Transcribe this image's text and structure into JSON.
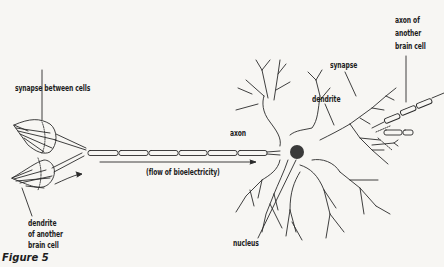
{
  "figure": {
    "caption": "Figure 5"
  },
  "labels": {
    "synapse_between_cells": "synapse between cells",
    "dendrite_other_1": "dendrite",
    "dendrite_other_2": "of another",
    "dendrite_other_3": "brain cell",
    "axon": "axon",
    "flow": "(flow of bioelectricity)",
    "nucleus": "nucleus",
    "dendrite": "dendrite",
    "synapse": "synapse",
    "axon_other_1": "axon of",
    "axon_other_2": "another",
    "axon_other_3": "brain cell"
  },
  "colors": {
    "ink": "#2a2a2a",
    "nucleus": "#3a3a3a",
    "paper": "#f7f6f3"
  }
}
